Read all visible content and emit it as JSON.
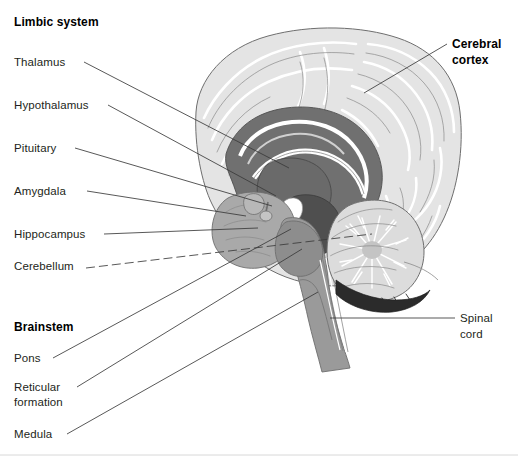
{
  "figure": {
    "background_color": "#ffffff",
    "width": 518,
    "height": 462
  },
  "palette": {
    "cortex_fill": "#e4e4e4",
    "cortex_outline": "#6e6e6e",
    "gyri_highlight": "#ffffff",
    "midbrain_mid_gray": "#a9a9a9",
    "deep_structure_gray": "#8d8d8d",
    "corpus_callosum_dark": "#707070",
    "darkest_gray": "#4f4f4f",
    "cerebellum_fill": "#dcdcdc",
    "brainstem_fill": "#9a9a9a",
    "leader_line": "#3a3a3a",
    "label_text": "#231f20",
    "baseline_rule": "#d8d8d8"
  },
  "headings": [
    {
      "id": "limbic-system",
      "label": "Limbic system",
      "bold": true,
      "x": 14,
      "y": 26
    },
    {
      "id": "brainstem",
      "label": "Brainstem",
      "bold": true,
      "x": 14,
      "y": 331
    }
  ],
  "labels": [
    {
      "id": "thalamus",
      "label": "Thalamus",
      "bold": false,
      "align": "left",
      "x": 14,
      "y": 66,
      "group": "limbic-system",
      "leader": {
        "type": "solid",
        "x1": 84,
        "y1": 62,
        "x2": 289,
        "y2": 168
      }
    },
    {
      "id": "hypothalamus",
      "label": "Hypothalamus",
      "bold": false,
      "align": "left",
      "x": 14,
      "y": 109,
      "group": "limbic-system",
      "leader": {
        "type": "solid",
        "x1": 108,
        "y1": 105,
        "x2": 276,
        "y2": 196
      }
    },
    {
      "id": "pituitary",
      "label": "Pituitary",
      "bold": false,
      "align": "left",
      "x": 14,
      "y": 152,
      "group": "limbic-system",
      "leader": {
        "type": "solid",
        "x1": 75,
        "y1": 148,
        "x2": 272,
        "y2": 206
      }
    },
    {
      "id": "amygdala",
      "label": "Amygdala",
      "bold": false,
      "align": "left",
      "x": 14,
      "y": 195,
      "group": "limbic-system",
      "leader": {
        "type": "solid",
        "x1": 87,
        "y1": 191,
        "x2": 246,
        "y2": 216
      }
    },
    {
      "id": "hippocampus",
      "label": "Hippocampus",
      "bold": false,
      "align": "left",
      "x": 14,
      "y": 238,
      "group": "limbic-system",
      "leader": {
        "type": "solid",
        "x1": 104,
        "y1": 234,
        "x2": 258,
        "y2": 228
      }
    },
    {
      "id": "cerebellum",
      "label": "Cerebellum",
      "bold": false,
      "align": "left",
      "x": 14,
      "y": 270,
      "group": "limbic-system",
      "leader": {
        "type": "dashed",
        "x1": 86,
        "y1": 268,
        "x2": 372,
        "y2": 234
      }
    },
    {
      "id": "pons",
      "label": "Pons",
      "bold": false,
      "align": "left",
      "x": 14,
      "y": 362,
      "group": "brainstem",
      "leader": {
        "type": "solid",
        "x1": 53,
        "y1": 358,
        "x2": 291,
        "y2": 229
      }
    },
    {
      "id": "reticular-formation",
      "label": "Reticular formation",
      "label_line_1": "Reticular",
      "label_line_2": "formation",
      "bold": false,
      "align": "left",
      "x": 14,
      "y": 391,
      "group": "brainstem",
      "leader": {
        "type": "solid",
        "x1": 77,
        "y1": 387,
        "x2": 302,
        "y2": 249
      }
    },
    {
      "id": "medula",
      "label": "Medula",
      "bold": false,
      "align": "left",
      "x": 14,
      "y": 438,
      "group": "brainstem",
      "leader": {
        "type": "solid",
        "x1": 67,
        "y1": 434,
        "x2": 318,
        "y2": 292
      }
    },
    {
      "id": "cerebral-cortex",
      "label": "Cerebral cortex",
      "label_line_1": "Cerebral",
      "label_line_2": "cortex",
      "bold": true,
      "align": "left",
      "x": 452,
      "y": 48,
      "group": null,
      "leader": {
        "type": "solid",
        "x1": 447,
        "y1": 44,
        "x2": 364,
        "y2": 93
      }
    },
    {
      "id": "spinal-cord",
      "label": "Spinal cord",
      "label_line_1": "Spinal",
      "label_line_2": "cord",
      "bold": false,
      "align": "left",
      "x": 460,
      "y": 322,
      "group": null,
      "leader": {
        "type": "solid",
        "x1": 455,
        "y1": 318,
        "x2": 330,
        "y2": 318
      }
    }
  ]
}
